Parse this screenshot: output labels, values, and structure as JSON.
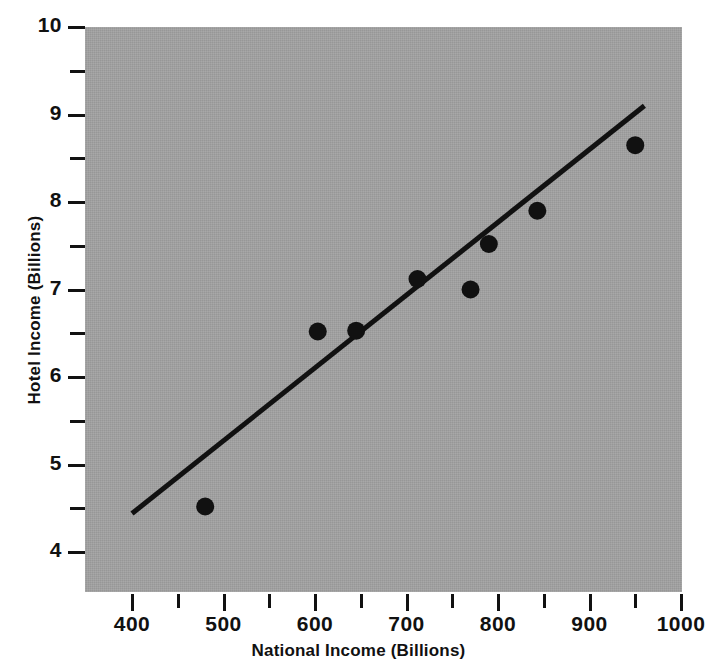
{
  "chart_data": {
    "type": "scatter",
    "title": "",
    "xlabel": "National Income (Billions)",
    "ylabel": "Hotel Income (Billions)",
    "xlim": [
      370,
      1020
    ],
    "ylim": [
      3.7,
      10.0
    ],
    "grid": false,
    "legend": null,
    "background_color": "#a2a2a2",
    "marker_color": "#111111",
    "line_color": "#111111",
    "x_major_ticks": [
      400,
      500,
      600,
      700,
      800,
      900,
      1000
    ],
    "x_minor_ticks": [
      450,
      550,
      650,
      750,
      850,
      950
    ],
    "x_tick_labels": [
      "400",
      "500",
      "600",
      "700",
      "800",
      "900",
      "1000"
    ],
    "y_major_ticks": [
      4,
      5,
      6,
      7,
      8,
      9,
      10
    ],
    "y_minor_ticks": [
      4.5,
      5.5,
      6.5,
      7.5,
      8.5,
      9.5
    ],
    "y_tick_labels": [
      "4",
      "5",
      "6",
      "7",
      "8",
      "9",
      "10"
    ],
    "points": [
      {
        "x": 480,
        "y": 4.52
      },
      {
        "x": 603,
        "y": 6.52
      },
      {
        "x": 645,
        "y": 6.53
      },
      {
        "x": 712,
        "y": 7.12
      },
      {
        "x": 770,
        "y": 7.0
      },
      {
        "x": 790,
        "y": 7.52
      },
      {
        "x": 843,
        "y": 7.9
      },
      {
        "x": 950,
        "y": 8.65
      }
    ],
    "trend_line": {
      "x_start": 400,
      "y_start": 4.44,
      "x_end": 960,
      "y_end": 9.1,
      "style": "solid",
      "width_px": 5
    }
  }
}
